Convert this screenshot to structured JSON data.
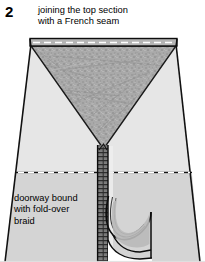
{
  "figure": {
    "step_number": "2",
    "caption_top": {
      "line1": "joining the top section",
      "line2": "with a French seam"
    },
    "caption_bottom": {
      "line1": "doorway bound",
      "line2": "with fold-over",
      "line3": "braid"
    },
    "colors": {
      "ink": "#000000",
      "paper": "#ffffff",
      "body_fill": "#d9d9d9",
      "body_fill_light": "#e8e8e8",
      "top_section_fill": "#a9a9a9",
      "top_band_fill": "#b8b8b8",
      "braid_fill": "#7a7a7a",
      "flap_fill": "#bdbdbd",
      "seam_dash": "#ffffff"
    },
    "parts": [
      {
        "name": "top-band",
        "label": "French seam band"
      },
      {
        "name": "top-section",
        "label": "top section (inverted triangle)"
      },
      {
        "name": "tent-body",
        "label": "tent body panel"
      },
      {
        "name": "horizontal-seam",
        "label": "dashed horizontal seam"
      },
      {
        "name": "doorway-braid",
        "label": "vertical fold-over braid"
      },
      {
        "name": "door-flap",
        "label": "curled door flap"
      }
    ]
  }
}
